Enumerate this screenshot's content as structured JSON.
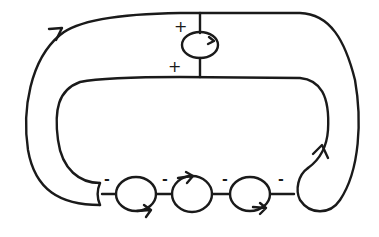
{
  "diagram": {
    "type": "knot-diagram",
    "stroke_color": "#1a1a1a",
    "background": "#ffffff",
    "top_twist": {
      "signs": [
        "+",
        "+"
      ],
      "orientation_arrow": "clockwise"
    },
    "bottom_twists": [
      {
        "sign": "-",
        "arrow": "bottom-right"
      },
      {
        "sign": "-",
        "arrow": "top-right"
      },
      {
        "sign": "-",
        "arrow": "none"
      },
      {
        "sign": "-",
        "arrow": "bottom-right"
      }
    ],
    "outer_arrow": "top-left, pointing right",
    "inner_arrow": "right side, pointing up"
  }
}
